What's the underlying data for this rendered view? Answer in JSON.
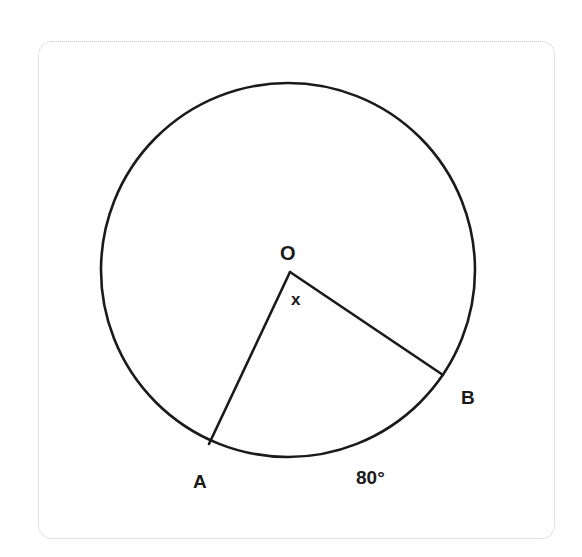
{
  "diagram": {
    "type": "circle-central-angle",
    "colors": {
      "stroke": "#1a1a1a",
      "card_border": "#c4c4c4",
      "background": "#ffffff"
    },
    "circle": {
      "cx": 288,
      "cy": 270,
      "r": 187
    },
    "center": {
      "label": "O",
      "x": 290,
      "y": 272
    },
    "points": [
      {
        "label": "A",
        "x": 209,
        "y": 444
      },
      {
        "label": "B",
        "x": 443,
        "y": 375
      }
    ],
    "angle_label": "x",
    "arc_label": "80°"
  }
}
